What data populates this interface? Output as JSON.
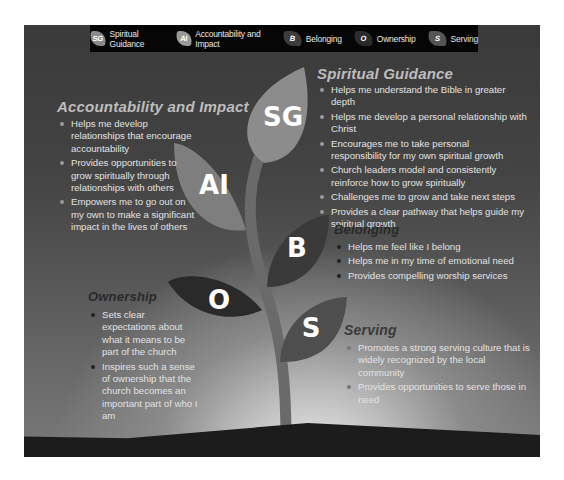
{
  "legend": {
    "items": [
      {
        "abbr": "SG",
        "label": "Spiritual Guidance",
        "color": "#8a8a8a"
      },
      {
        "abbr": "AI",
        "label": "Accountability and Impact",
        "color": "#9a9a9a"
      },
      {
        "abbr": "B",
        "label": "Belonging",
        "color": "#3c3c3c"
      },
      {
        "abbr": "O",
        "label": "Ownership",
        "color": "#2b2b2b"
      },
      {
        "abbr": "S",
        "label": "Serving",
        "color": "#555555"
      }
    ]
  },
  "leaves": {
    "sg": {
      "abbr": "SG",
      "color": "#8c8c8c"
    },
    "ai": {
      "abbr": "AI",
      "color": "#7e7e7e"
    },
    "b": {
      "abbr": "B",
      "color": "#3a3a3a"
    },
    "o": {
      "abbr": "O",
      "color": "#2a2a2a"
    },
    "s": {
      "abbr": "S",
      "color": "#4e4e4e"
    }
  },
  "sections": {
    "spiritual_guidance": {
      "title": "Spiritual Guidance",
      "bullets": [
        "Helps me understand the Bible in greater depth",
        "Helps me develop a personal relationship with Christ",
        "Encourages me to take personal responsibility for my own spiritual growth",
        "Church leaders model and consistently reinforce how to grow spiritually",
        "Challenges me to grow and take next steps",
        "Provides a clear pathway that helps guide my spiritual growth"
      ]
    },
    "accountability": {
      "title": "Accountability and Impact",
      "bullets": [
        "Helps me develop relationships that encourage accountability",
        "Provides opportunities to grow spiritually through relationships with others",
        "Empowers me to go out on my own to make a significant impact in the lives of others"
      ]
    },
    "belonging": {
      "title": "Belonging",
      "bullets": [
        "Helps me feel like I belong",
        "Helps me in my time of emotional need",
        "Provides compelling worship services"
      ]
    },
    "ownership": {
      "title": "Ownership",
      "bullets": [
        "Sets clear expectations about what it means to be part of the church",
        "Inspires such a sense of ownership that the church becomes an important part of who I am"
      ]
    },
    "serving": {
      "title": "Serving",
      "bullets": [
        "Promotes a strong serving culture that is widely recognized by the local community",
        "Provides opportunities to serve those in need"
      ]
    }
  }
}
